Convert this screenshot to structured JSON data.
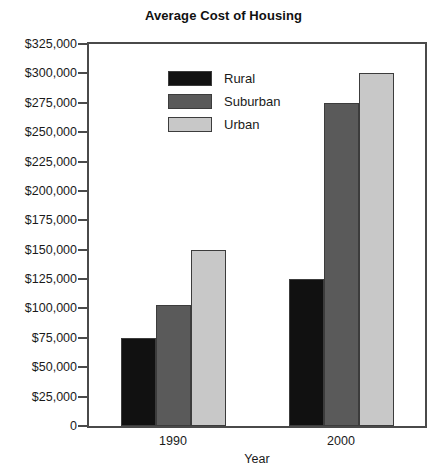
{
  "chart_data": {
    "type": "bar",
    "title": "Average Cost of Housing",
    "xlabel": "Year",
    "ylabel": "",
    "categories": [
      "1990",
      "2000"
    ],
    "series": [
      {
        "name": "Rural",
        "values": [
          75000,
          125000
        ],
        "color": "#111111"
      },
      {
        "name": "Suburban",
        "values": [
          103000,
          275000
        ],
        "color": "#5a5a5a"
      },
      {
        "name": "Urban",
        "values": [
          150000,
          300000
        ],
        "color": "#c8c8c8"
      }
    ],
    "ylim": [
      0,
      325000
    ],
    "ytick_step": 25000,
    "ytick_labels": [
      "$325,000",
      "$300,000",
      "$275,000",
      "$250,000",
      "$225,000",
      "$200,000",
      "$175,000",
      "$150,000",
      "$125,000",
      "$100,000",
      "$75,000",
      "$50,000",
      "$25,000",
      "0"
    ],
    "ytick_values": [
      325000,
      300000,
      275000,
      250000,
      225000,
      200000,
      175000,
      150000,
      125000,
      100000,
      75000,
      50000,
      25000,
      0
    ],
    "grid": false,
    "legend_position": "inside-top-center",
    "frame_color": "#4a4a4a",
    "bar_border_color": "#3c3c3c",
    "background": "#ffffff"
  }
}
